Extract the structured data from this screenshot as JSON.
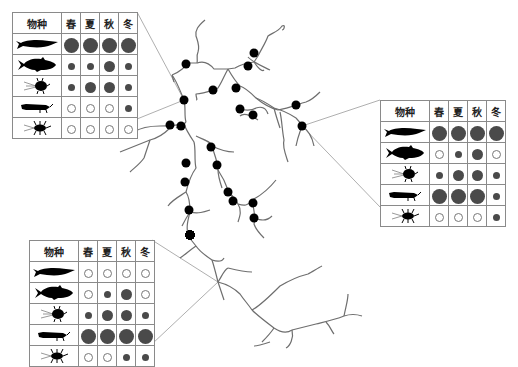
{
  "figure": {
    "header_labels": {
      "species": "物种",
      "spring": "春",
      "summer": "夏",
      "autumn": "秋",
      "winter": "冬"
    },
    "legend_sizes": [
      "large",
      "medium",
      "small",
      "empty"
    ],
    "species": [
      {
        "id": "pike-fish",
        "icon": "pike-fish-icon"
      },
      {
        "id": "bass-fish",
        "icon": "bass-fish-icon"
      },
      {
        "id": "nymph-insect",
        "icon": "nymph-insect-icon"
      },
      {
        "id": "larva-insect",
        "icon": "larva-insect-icon"
      },
      {
        "id": "stonefly-insect",
        "icon": "stonefly-insect-icon"
      }
    ],
    "tables": [
      {
        "name": "upper-left-site",
        "rows": [
          [
            "large",
            "large",
            "large",
            "large"
          ],
          [
            "small",
            "small",
            "medium",
            "small"
          ],
          [
            "small",
            "medium",
            "medium",
            "small"
          ],
          [
            "empty",
            "empty",
            "empty",
            "small"
          ],
          [
            "empty",
            "empty",
            "empty",
            "empty"
          ]
        ]
      },
      {
        "name": "right-site",
        "rows": [
          [
            "large",
            "large",
            "large",
            "large"
          ],
          [
            "empty",
            "small",
            "medium",
            "empty"
          ],
          [
            "small",
            "medium",
            "medium",
            "small"
          ],
          [
            "large",
            "large",
            "large",
            "small"
          ],
          [
            "empty",
            "empty",
            "empty",
            "small"
          ]
        ]
      },
      {
        "name": "lower-left-site",
        "rows": [
          [
            "empty",
            "empty",
            "empty",
            "empty"
          ],
          [
            "empty",
            "small",
            "medium",
            "empty"
          ],
          [
            "small",
            "medium",
            "medium",
            "small"
          ],
          [
            "large",
            "large",
            "large",
            "large"
          ],
          [
            "empty",
            "empty",
            "small",
            "small"
          ]
        ]
      }
    ],
    "colors": {
      "river": "#6e6e6e",
      "site": "#000000",
      "dot_fill": "#4a4a4a",
      "grid": "#8a8a8a"
    }
  }
}
